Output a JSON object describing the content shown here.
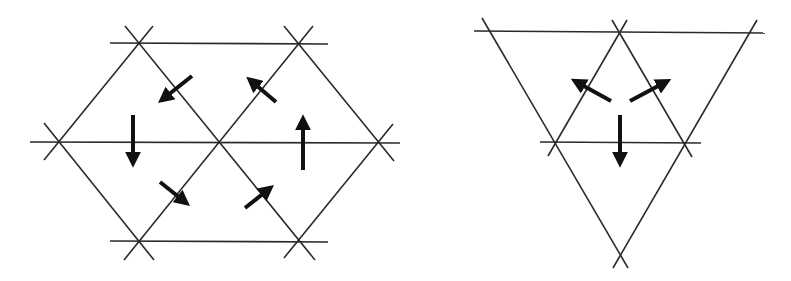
{
  "figure": {
    "panels": [
      {
        "id": "left",
        "shape": "hexagon",
        "arrow_count": 6,
        "arrows": [
          "down-left",
          "up-left",
          "down",
          "up",
          "down-right",
          "up-right"
        ]
      },
      {
        "id": "right",
        "shape": "triangle",
        "arrow_count": 3,
        "arrows": [
          "up-left",
          "up-right",
          "down"
        ]
      }
    ],
    "colors": {
      "lines": "#2a2a2a",
      "arrows": "#111111",
      "background": "#ffffff"
    }
  }
}
